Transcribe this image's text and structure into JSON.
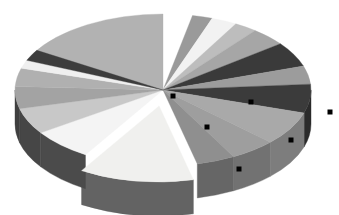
{
  "document": {
    "title": "3D Exploded Pie Chart",
    "background_color": "#ffffff",
    "width": 339,
    "height": 215
  },
  "chart_data": {
    "type": "pie",
    "title": "",
    "subtitle": "",
    "xlabel": "",
    "ylabel": "",
    "grid": false,
    "legend": "none",
    "style": "3d-exploded-pie",
    "three_d": true,
    "grayscale": true,
    "depth_px": 34,
    "center": {
      "x": 163,
      "y": 90
    },
    "radius": {
      "rx": 148,
      "ry": 76
    },
    "start_angle_deg": -90,
    "direction": "clockwise",
    "selected_slice_index": 11,
    "selection_handle_color": "#000000",
    "selection_handle_size": 5,
    "categories": [
      "Item 1",
      "Item 2",
      "Item 3",
      "Item 4",
      "Item 5",
      "Item 6",
      "Item 7",
      "Item 8",
      "Item 9",
      "Item 10",
      "Item 11",
      "Item 12",
      "Item 13",
      "Item 14",
      "Item 15",
      "Item 16",
      "Item 17",
      "Item 18"
    ],
    "values": [
      3.2,
      2.2,
      2.8,
      2.5,
      3.9,
      5.3,
      3.9,
      6.1,
      7.2,
      5.0,
      4.2,
      12.5,
      6.7,
      5.6,
      4.7,
      3.9,
      3.3,
      17.0
    ],
    "slices": [
      {
        "label": "Item 1",
        "value": 3.2,
        "start_deg": -90.0,
        "end_deg": -78.5,
        "color": "#ffffff",
        "side_color": "#ffffff",
        "exploded": false
      },
      {
        "label": "Item 2",
        "value": 2.2,
        "start_deg": -78.5,
        "end_deg": -70.6,
        "color": "#9a9a9a",
        "side_color": "#6e6e6e",
        "exploded": false
      },
      {
        "label": "Item 3",
        "value": 2.8,
        "start_deg": -70.6,
        "end_deg": -60.5,
        "color": "#f2f2f2",
        "side_color": "#b4b4b4",
        "exploded": false
      },
      {
        "label": "Item 4",
        "value": 2.5,
        "start_deg": -60.5,
        "end_deg": -51.5,
        "color": "#bdbdbd",
        "side_color": "#8c8c8c",
        "exploded": false
      },
      {
        "label": "Item 5",
        "value": 3.9,
        "start_deg": -51.5,
        "end_deg": -37.5,
        "color": "#a6a6a6",
        "side_color": "#7a7a7a",
        "exploded": false
      },
      {
        "label": "Item 6",
        "value": 5.3,
        "start_deg": -37.5,
        "end_deg": -18.4,
        "color": "#3a3a3a",
        "side_color": "#2a2a2a",
        "exploded": false
      },
      {
        "label": "Item 7",
        "value": 3.9,
        "start_deg": -18.4,
        "end_deg": -4.4,
        "color": "#9c9c9c",
        "side_color": "#707070",
        "exploded": false
      },
      {
        "label": "Item 8",
        "value": 6.1,
        "start_deg": -4.4,
        "end_deg": 17.6,
        "color": "#3b3b3b",
        "side_color": "#2b2b2b",
        "exploded": false
      },
      {
        "label": "Item 9",
        "value": 7.2,
        "start_deg": 17.6,
        "end_deg": 43.5,
        "color": "#a9a9a9",
        "side_color": "#7d7d7d",
        "exploded": false
      },
      {
        "label": "Item 10",
        "value": 5.0,
        "start_deg": 43.5,
        "end_deg": 61.5,
        "color": "#9e9e9e",
        "side_color": "#727272",
        "exploded": false
      },
      {
        "label": "Item 11",
        "value": 4.2,
        "start_deg": 61.5,
        "end_deg": 76.6,
        "color": "#8f8f8f",
        "side_color": "#666666",
        "exploded": false
      },
      {
        "label": "Item 12",
        "value": 12.5,
        "start_deg": 76.6,
        "end_deg": 121.6,
        "color": "#f0f0ee",
        "side_color": "#636363",
        "exploded": true
      },
      {
        "label": "Item 13",
        "value": 6.7,
        "start_deg": 121.6,
        "end_deg": 145.7,
        "color": "#f4f4f4",
        "side_color": "#4b4b4b",
        "exploded": false
      },
      {
        "label": "Item 14",
        "value": 5.6,
        "start_deg": 145.7,
        "end_deg": 165.8,
        "color": "#c8c8c8",
        "side_color": "#464646",
        "exploded": false
      },
      {
        "label": "Item 15",
        "value": 4.7,
        "start_deg": 165.8,
        "end_deg": 182.7,
        "color": "#a3a3a3",
        "side_color": "#3f3f3f",
        "exploded": false
      },
      {
        "label": "Item 16",
        "value": 3.9,
        "start_deg": 182.7,
        "end_deg": 196.7,
        "color": "#b0b0b0",
        "side_color": "#434343",
        "exploded": false
      },
      {
        "label": "Item 17",
        "value": 3.3,
        "start_deg": 196.7,
        "end_deg": 208.6,
        "color": "#efefef",
        "side_color": "#4a4a4a",
        "exploded": false
      },
      {
        "label": "Item 18",
        "value": 17.0,
        "start_deg": 208.6,
        "end_deg": 270.0,
        "color": "#b2b2b2",
        "side_color": "#4c4c4c",
        "exploded": false
      }
    ],
    "extra_wedges": [
      {
        "label": "Left dark band",
        "start_deg": 203.0,
        "end_deg": 211.5,
        "color": "#3d3d3d",
        "side_color": "#414141"
      }
    ],
    "selection_handles": [
      {
        "x": 173,
        "y": 96
      },
      {
        "x": 251,
        "y": 102
      },
      {
        "x": 330,
        "y": 112
      },
      {
        "x": 291,
        "y": 140
      },
      {
        "x": 239,
        "y": 169
      },
      {
        "x": 207,
        "y": 127
      }
    ]
  }
}
